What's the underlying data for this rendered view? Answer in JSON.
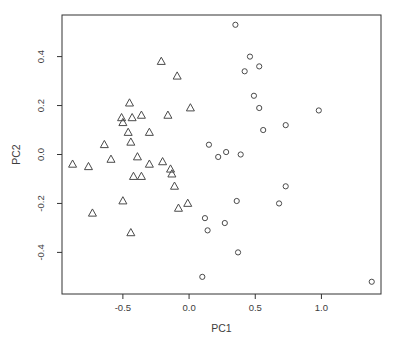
{
  "chart_data": {
    "type": "scatter",
    "title": "",
    "xlabel": "PC1",
    "ylabel": "PC2",
    "xlim": [
      -0.96,
      1.45
    ],
    "ylim": [
      -0.57,
      0.57
    ],
    "x_ticks": [
      -0.5,
      0,
      0.5,
      1
    ],
    "y_ticks": [
      -0.4,
      -0.2,
      0,
      0.2,
      0.4
    ],
    "grid": false,
    "legend_position": "none",
    "series": [
      {
        "name": "triangle-group",
        "marker": "triangle-open",
        "points": [
          [
            -0.21,
            0.38
          ],
          [
            -0.09,
            0.32
          ],
          [
            -0.45,
            0.21
          ],
          [
            0.01,
            0.19
          ],
          [
            -0.51,
            0.15
          ],
          [
            -0.43,
            0.15
          ],
          [
            -0.36,
            0.16
          ],
          [
            -0.16,
            0.16
          ],
          [
            -0.5,
            0.13
          ],
          [
            -0.46,
            0.09
          ],
          [
            -0.3,
            0.09
          ],
          [
            -0.44,
            0.05
          ],
          [
            -0.64,
            0.04
          ],
          [
            -0.59,
            -0.02
          ],
          [
            -0.39,
            -0.01
          ],
          [
            -0.88,
            -0.04
          ],
          [
            -0.76,
            -0.05
          ],
          [
            -0.3,
            -0.04
          ],
          [
            -0.2,
            -0.03
          ],
          [
            -0.14,
            -0.06
          ],
          [
            -0.13,
            -0.08
          ],
          [
            -0.42,
            -0.09
          ],
          [
            -0.36,
            -0.09
          ],
          [
            -0.11,
            -0.13
          ],
          [
            -0.01,
            -0.2
          ],
          [
            -0.08,
            -0.22
          ],
          [
            -0.5,
            -0.19
          ],
          [
            -0.73,
            -0.24
          ],
          [
            -0.44,
            -0.32
          ]
        ]
      },
      {
        "name": "circle-group",
        "marker": "circle-open",
        "points": [
          [
            0.35,
            0.53
          ],
          [
            0.46,
            0.4
          ],
          [
            0.53,
            0.36
          ],
          [
            0.42,
            0.34
          ],
          [
            0.49,
            0.24
          ],
          [
            0.53,
            0.19
          ],
          [
            0.98,
            0.18
          ],
          [
            0.73,
            0.12
          ],
          [
            0.56,
            0.1
          ],
          [
            0.15,
            0.04
          ],
          [
            0.28,
            0.01
          ],
          [
            0.39,
            0.0
          ],
          [
            0.22,
            -0.01
          ],
          [
            0.36,
            -0.19
          ],
          [
            0.68,
            -0.2
          ],
          [
            0.73,
            -0.13
          ],
          [
            0.12,
            -0.26
          ],
          [
            0.27,
            -0.28
          ],
          [
            0.14,
            -0.31
          ],
          [
            0.37,
            -0.4
          ],
          [
            0.1,
            -0.5
          ],
          [
            1.38,
            -0.52
          ]
        ]
      }
    ]
  },
  "style": {
    "background": "#ffffff",
    "axis_color": "#333333",
    "text_color": "#3d3d3d",
    "point_color": "#4a4a4a"
  }
}
